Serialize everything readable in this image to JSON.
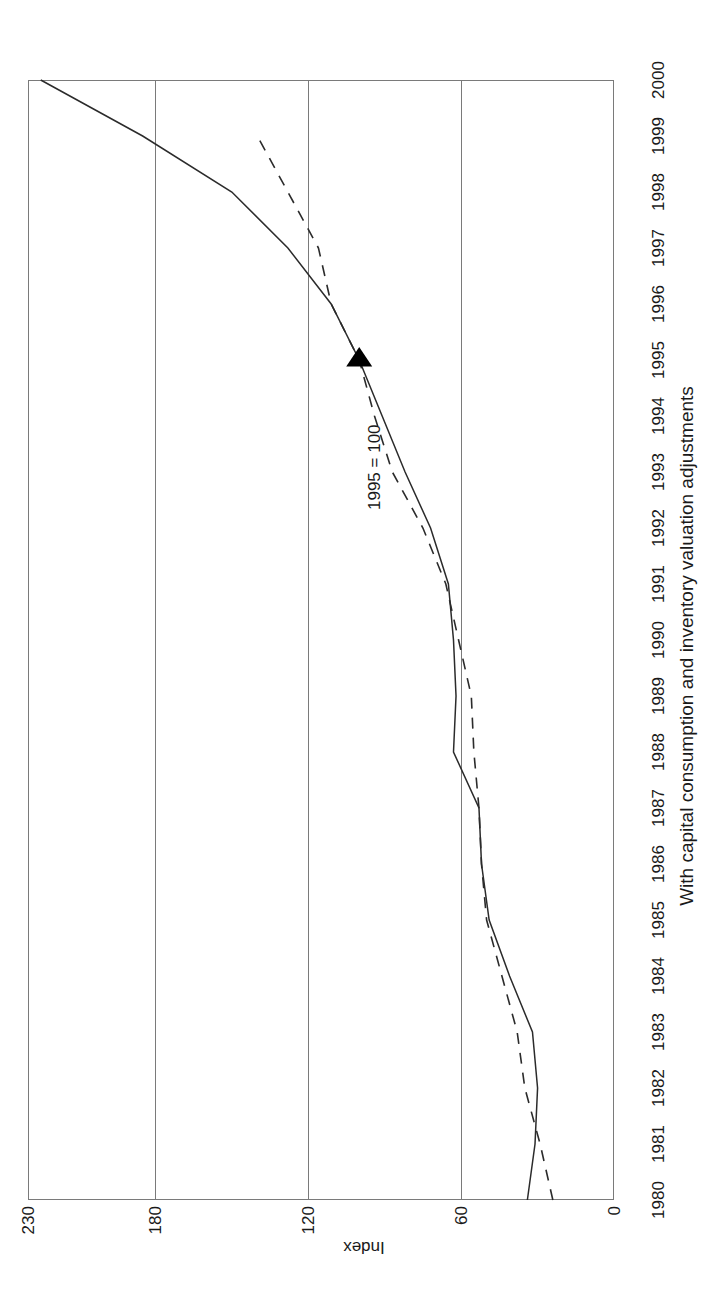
{
  "chart_data": {
    "type": "line",
    "title": "",
    "subtitle": "With capital consumption and inventory valuation adjustments",
    "xlabel": "",
    "ylabel": "Index",
    "annotation": "1995 = 100",
    "xlim": [
      1980,
      2000
    ],
    "ylim": [
      0,
      230
    ],
    "yticks": [
      0,
      60,
      120,
      180,
      230
    ],
    "ytick_labels": [
      "0",
      "60",
      "120",
      "180",
      "230"
    ],
    "grid": "horizontal-only",
    "legend": "none",
    "orientation": "rotated-90",
    "marker": {
      "shape": "triangle",
      "x": 1995,
      "y": 100
    },
    "x": [
      1980,
      1981,
      1982,
      1983,
      1984,
      1985,
      1986,
      1987,
      1988,
      1989,
      1990,
      1991,
      1992,
      1993,
      1994,
      1995,
      1996,
      1997,
      1998,
      1999,
      2000
    ],
    "categories": [
      "1980",
      "1981",
      "1982",
      "1983",
      "1984",
      "1985",
      "1986",
      "1987",
      "1988",
      "1989",
      "1990",
      "1991",
      "1992",
      "1993",
      "1994",
      "1995",
      "1996",
      "1997",
      "1998",
      "1999",
      "2000"
    ],
    "series": [
      {
        "name": "Solid series",
        "style": "solid",
        "values": [
          34,
          31,
          30,
          32,
          41,
          49,
          52,
          53,
          63,
          62,
          63,
          65,
          72,
          82,
          91,
          100,
          111,
          128,
          150,
          185,
          225
        ]
      },
      {
        "name": "Dashed series",
        "style": "dashed",
        "values": [
          24,
          29,
          35,
          38,
          44,
          50,
          52,
          53,
          55,
          56,
          61,
          66,
          75,
          87,
          94,
          100,
          111,
          116,
          128,
          140,
          null
        ]
      }
    ]
  },
  "axis": {
    "y_title": "Index",
    "y_tick_labels": [
      "0",
      "60",
      "120",
      "180",
      "230"
    ],
    "x_tick_labels": [
      "1980",
      "1981",
      "1982",
      "1983",
      "1984",
      "1985",
      "1986",
      "1987",
      "1988",
      "1989",
      "1990",
      "1991",
      "1992",
      "1993",
      "1994",
      "1995",
      "1996",
      "1997",
      "1998",
      "1999",
      "2000"
    ]
  },
  "labels": {
    "subtitle": "With capital consumption and inventory valuation adjustments",
    "annotation": "1995 = 100"
  }
}
